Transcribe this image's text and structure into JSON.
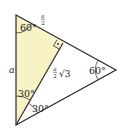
{
  "diagram": {
    "colors": {
      "fill_highlight": "#f7f3c4",
      "stroke": "#2a2a2a",
      "background": "#ffffff"
    },
    "vertices": {
      "top": [
        16,
        15
      ],
      "bottom": [
        16,
        125
      ],
      "right": [
        116,
        70
      ],
      "foot": [
        63,
        43
      ]
    },
    "labels": {
      "side_a": "a",
      "half_side": "a/2",
      "half_side_num": "a",
      "half_side_den": "2",
      "altitude_coef_num": "a",
      "altitude_coef_den": "2",
      "altitude_sqrt": "√3",
      "angle_top": "60°",
      "angle_right": "60°",
      "angle_bottom_upper": "30°",
      "angle_bottom_lower": "30°",
      "right_angle_mark": "·"
    }
  }
}
